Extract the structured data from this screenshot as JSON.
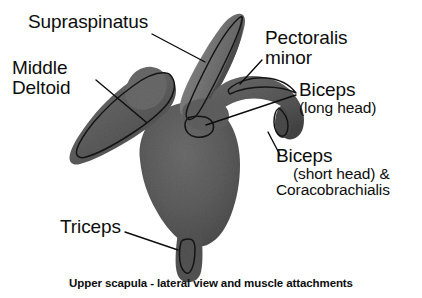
{
  "figure": {
    "title": "Upper scapula - lateral view and muscle attachments",
    "caption": "Upper scapula - lateral view and muscle attachments",
    "background_color": "#ffffff",
    "text_color": "#0d0d0d",
    "bone_fill_color": "#5d5d5d",
    "bone_highlight_color": "#8a8a8a",
    "outline_color": "#141414",
    "leader_line_color": "#0d0d0d"
  },
  "labels": [
    {
      "id": "supraspinatus",
      "name": "Supraspinatus",
      "lines": [
        "Supraspinatus"
      ],
      "sub_lines": []
    },
    {
      "id": "middle-deltoid",
      "name": "Middle Deltoid",
      "lines": [
        "Middle",
        "Deltoid"
      ],
      "sub_lines": []
    },
    {
      "id": "pectoralis-minor",
      "name": "Pectoralis minor",
      "lines": [
        "Pectoralis",
        "minor"
      ],
      "sub_lines": []
    },
    {
      "id": "biceps-long-head",
      "name": "Biceps (long head)",
      "lines": [
        "Biceps"
      ],
      "sub_lines": [
        "(long head)"
      ]
    },
    {
      "id": "biceps-short-head",
      "name": "Biceps (short head) & Coracobrachialis",
      "lines": [
        "Biceps"
      ],
      "sub_lines": [
        "(short head) &",
        "Coracobrachialis"
      ]
    },
    {
      "id": "triceps",
      "name": "Triceps",
      "lines": [
        "Triceps"
      ],
      "sub_lines": []
    }
  ],
  "label_text": {
    "supraspinatus": "Supraspinatus",
    "middle_deltoid_line1": "Middle",
    "middle_deltoid_line2": "Deltoid",
    "pectoralis_line1": "Pectoralis",
    "pectoralis_line2": "minor",
    "biceps_long_main": "Biceps",
    "biceps_long_sub": "(long head)",
    "biceps_short_main": "Biceps",
    "biceps_short_sub1": "(short head) &",
    "biceps_short_sub2": "Coracobrachialis",
    "triceps": "Triceps"
  }
}
